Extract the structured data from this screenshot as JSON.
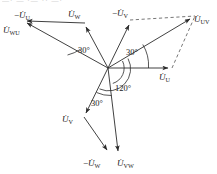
{
  "figure": {
    "title_fragment": "—· —  ·—  ·· —·",
    "background_color": "#ffffff",
    "line_color": "#2b2b2b",
    "dashed_color": "#4a4a4a"
  },
  "labels": {
    "minus_u_u": {
      "prefix": "−",
      "symbol": "U̇",
      "sub": "U"
    },
    "u_w": {
      "prefix": "",
      "symbol": "U̇",
      "sub": "W"
    },
    "u_wu": {
      "prefix": "",
      "symbol": "U̇",
      "sub": "WU"
    },
    "minus_u_v": {
      "prefix": "−",
      "symbol": "U̇",
      "sub": "V"
    },
    "u_uv": {
      "prefix": "",
      "symbol": "U̇",
      "sub": "UV"
    },
    "u_u": {
      "prefix": "",
      "symbol": "U̇",
      "sub": "U"
    },
    "u_v": {
      "prefix": "",
      "symbol": "U̇",
      "sub": "V"
    },
    "minus_u_w": {
      "prefix": "−",
      "symbol": "U̇",
      "sub": "W"
    },
    "u_vw": {
      "prefix": "",
      "symbol": "U̇",
      "sub": "VW"
    }
  },
  "angles": {
    "upper_left_30": "30°",
    "upper_right_30": "30°",
    "lower_left_30": "30°",
    "center_120": "120°"
  },
  "geometry": {
    "origin": {
      "x": 108,
      "y": 68
    },
    "vectors": [
      {
        "name": "u-u",
        "x1": 108,
        "y1": 68,
        "x2": 172,
        "y2": 68,
        "style": "solid"
      },
      {
        "name": "minus-u-u",
        "x1": 108,
        "y1": 68,
        "x2": 23,
        "y2": 21,
        "style": "solid"
      },
      {
        "name": "u-w",
        "x1": 108,
        "y1": 68,
        "x2": 85,
        "y2": 23,
        "style": "solid"
      },
      {
        "name": "u-wu",
        "x1": 85,
        "y1": 23,
        "x2": 23,
        "y2": 21,
        "style": "solid"
      },
      {
        "name": "minus-u-v",
        "x1": 108,
        "y1": 68,
        "x2": 130,
        "y2": 20,
        "style": "solid"
      },
      {
        "name": "u-uv",
        "x1": 108,
        "y1": 68,
        "x2": 195,
        "y2": 16,
        "style": "solid"
      },
      {
        "name": "u-v",
        "x1": 108,
        "y1": 68,
        "x2": 84,
        "y2": 117,
        "style": "solid"
      },
      {
        "name": "minus-u-w",
        "x1": 84,
        "y1": 117,
        "x2": 110,
        "y2": 154,
        "style": "solid"
      },
      {
        "name": "u-vw",
        "x1": 108,
        "y1": 68,
        "x2": 119,
        "y2": 155,
        "style": "solid"
      },
      {
        "name": "dash-top",
        "x1": 130,
        "y1": 20,
        "x2": 195,
        "y2": 16,
        "style": "dashed"
      },
      {
        "name": "dash-right",
        "x1": 172,
        "y1": 68,
        "x2": 195,
        "y2": 16,
        "style": "dashed"
      }
    ]
  }
}
